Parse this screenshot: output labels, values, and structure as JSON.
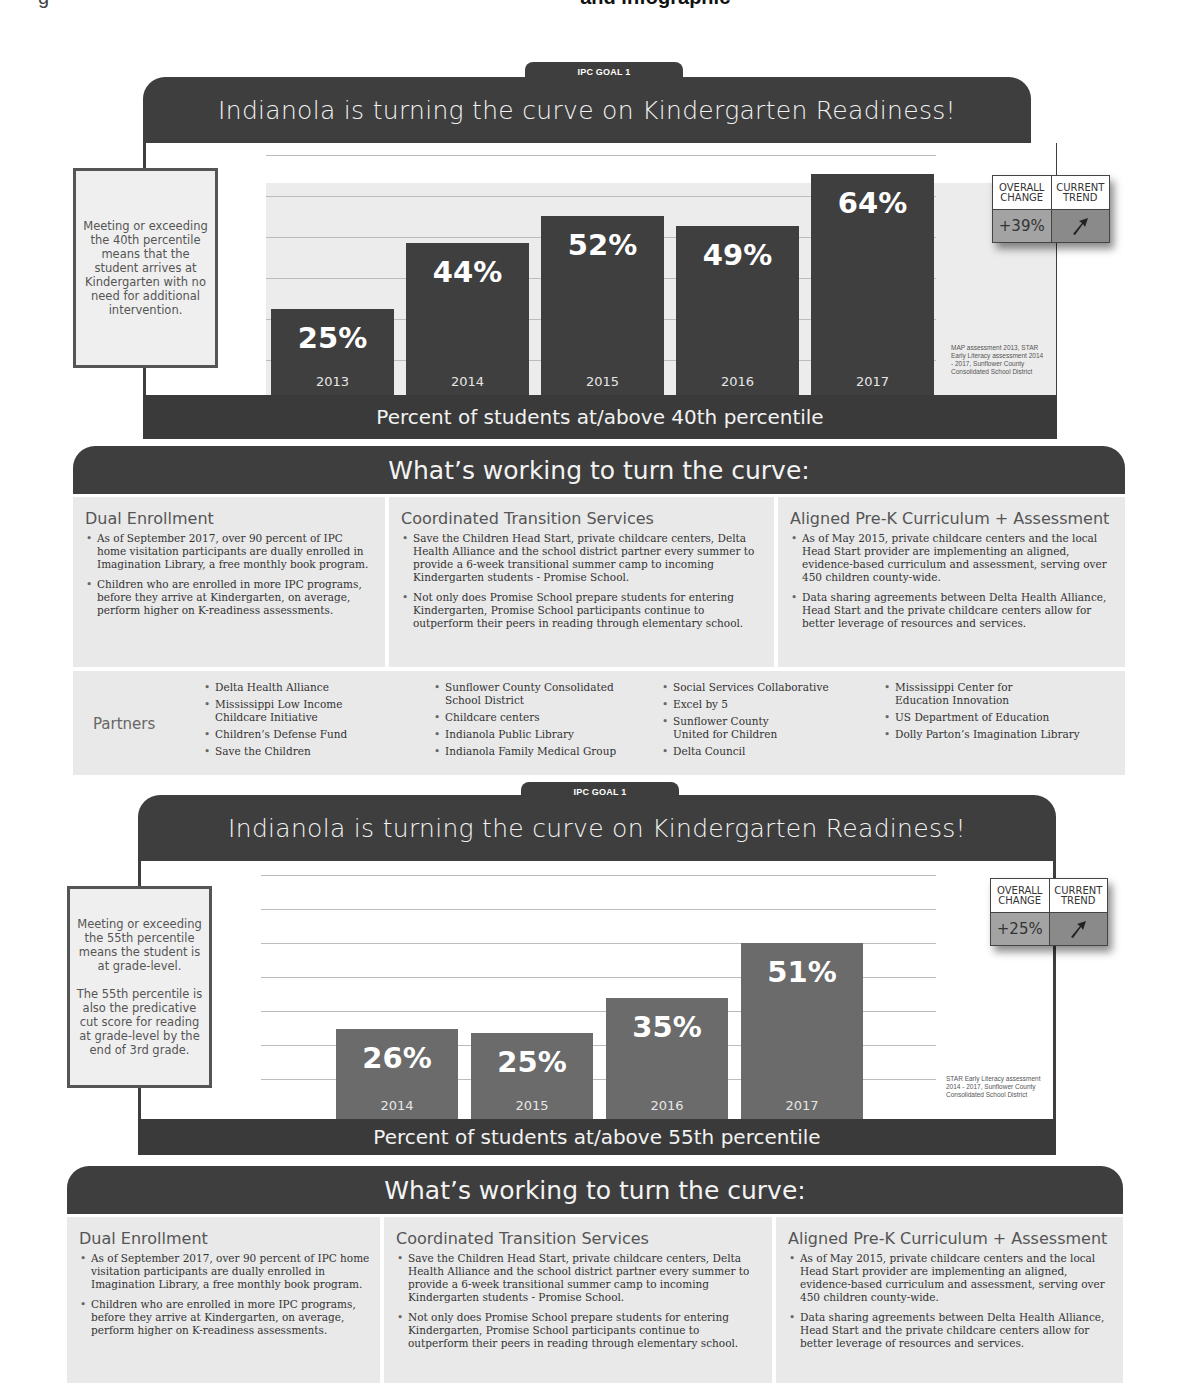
{
  "caption": {
    "prefix": "g",
    "bold_suffix": "and infographic"
  },
  "goals": [
    {
      "tab_label": "IPC GOAL 1",
      "title": "Indianola is turning the curve on Kindergarten Readiness!",
      "note_paragraphs": [
        "Meeting or exceeding the 40th percentile means that the student arrives at Kindergarten with no need for additional intervention."
      ],
      "footer": "Percent of students at/above 40th percentile",
      "source": "MAP assessment 2013, STAR Early Literacy assessment 2014 - 2017, Sunflower County Consolidated School District",
      "change": {
        "overall_label": "OVERALL CHANGE",
        "trend_label": "CURRENT TREND",
        "overall_value": "+39%",
        "trend_icon": "arrow-up-right-icon"
      },
      "bar_color": "#3f3f3f",
      "bars": [
        {
          "year": "2013",
          "label": "25%",
          "value": 25
        },
        {
          "year": "2014",
          "label": "44%",
          "value": 44
        },
        {
          "year": "2015",
          "label": "52%",
          "value": 52
        },
        {
          "year": "2016",
          "label": "49%",
          "value": 49
        },
        {
          "year": "2017",
          "label": "64%",
          "value": 64
        }
      ]
    },
    {
      "tab_label": "IPC GOAL 1",
      "title": "Indianola is turning the curve on Kindergarten Readiness!",
      "note_paragraphs": [
        "Meeting or exceeding the 55th percentile means the student is at grade-level.",
        "The 55th percentile is also the predicative cut score for reading at grade-level by the end of 3rd grade."
      ],
      "footer": "Percent of students at/above 55th percentile",
      "source": "STAR Early Literacy assessment 2014 - 2017, Sunflower County Consolidated School District",
      "change": {
        "overall_label": "OVERALL CHANGE",
        "trend_label": "CURRENT TREND",
        "overall_value": "+25%",
        "trend_icon": "arrow-up-right-icon"
      },
      "bar_color": "#6b6b6b",
      "bars": [
        {
          "year": "2014",
          "label": "26%",
          "value": 26
        },
        {
          "year": "2015",
          "label": "25%",
          "value": 25
        },
        {
          "year": "2016",
          "label": "35%",
          "value": 35
        },
        {
          "year": "2017",
          "label": "51%",
          "value": 51
        }
      ]
    }
  ],
  "working": [
    {
      "header": "What’s working to turn the curve:",
      "columns": [
        {
          "title": "Dual Enrollment",
          "items": [
            "As of September 2017, over 90 percent of IPC home visitation participants are dually enrolled in Imagination Library, a free monthly book program.",
            "Children who are enrolled in more IPC programs, before they arrive at Kindergarten, on average, perform higher on K-readiness assessments."
          ]
        },
        {
          "title": "Coordinated Transition Services",
          "items": [
            "Save the Children Head Start, private childcare centers, Delta Health Alliance and the school district partner every summer to provide a 6-week transitional summer camp to incoming Kindergarten students - Promise School.",
            "Not only does Promise School prepare students for entering Kindergarten, Promise School participants continue to outperform their peers in reading through elementary school."
          ]
        },
        {
          "title": "Aligned Pre-K Curriculum + Assessment",
          "items": [
            "As of May 2015, private childcare centers and the local Head Start provider are implementing an aligned, evidence-based curriculum and assessment, serving over 450 children county-wide.",
            "Data sharing agreements between Delta Health Alliance, Head Start and the private childcare centers allow for better leverage of resources and services."
          ]
        }
      ],
      "partners": {
        "label": "Partners",
        "groups": [
          [
            "Delta Health Alliance",
            "Mississippi Low Income Childcare Initiative",
            "Children’s Defense Fund",
            "Save the Children"
          ],
          [
            "Sunflower County Consolidated School District",
            "Childcare centers",
            "Indianola Public Library",
            "Indianola Family Medical Group"
          ],
          [
            "Social Services Collaborative",
            "Excel by 5",
            "Sunflower County United for Children",
            "Delta Council"
          ],
          [
            "Mississippi Center for Education Innovation",
            "US Department of Education",
            "Dolly Parton’s Imagination Library"
          ]
        ]
      }
    },
    {
      "header": "What’s working to turn the curve:",
      "columns": [
        {
          "title": "Dual Enrollment",
          "items": [
            "As of September 2017, over 90 percent of IPC home visitation participants are dually enrolled in Imagination Library, a free monthly book program.",
            "Children who are enrolled in more IPC programs, before they arrive at Kindergarten, on average, perform higher on K-readiness assessments."
          ]
        },
        {
          "title": "Coordinated Transition Services",
          "items": [
            "Save the Children Head Start, private childcare centers, Delta Health Alliance and the school district partner every summer to provide a 6-week transitional summer camp to incoming Kindergarten students - Promise School.",
            "Not only does Promise School prepare students for entering Kindergarten, Promise School participants continue to outperform their peers in reading through elementary school."
          ]
        },
        {
          "title": "Aligned Pre-K Curriculum + Assessment",
          "items": [
            "As of May 2015, private childcare centers and the local Head Start provider are implementing an aligned, evidence-based curriculum and assessment, serving over 450 children county-wide.",
            "Data sharing agreements between Delta Health Alliance, Head Start and the private childcare centers allow for better leverage of resources and services."
          ]
        }
      ]
    }
  ],
  "chart_data": [
    {
      "type": "bar",
      "title": "Indianola is turning the curve on Kindergarten Readiness!",
      "xlabel": "Percent of students at/above 40th percentile",
      "ylabel": "",
      "categories": [
        "2013",
        "2014",
        "2015",
        "2016",
        "2017"
      ],
      "values": [
        25,
        44,
        52,
        49,
        64
      ],
      "ylim": [
        0,
        70
      ],
      "grid": true,
      "annotations": [
        "OVERALL CHANGE +39%",
        "CURRENT TREND up"
      ]
    },
    {
      "type": "bar",
      "title": "Indianola is turning the curve on Kindergarten Readiness!",
      "xlabel": "Percent of students at/above 55th percentile",
      "ylabel": "",
      "categories": [
        "2014",
        "2015",
        "2016",
        "2017"
      ],
      "values": [
        26,
        25,
        35,
        51
      ],
      "ylim": [
        0,
        70
      ],
      "grid": true,
      "annotations": [
        "OVERALL CHANGE +25%",
        "CURRENT TREND up"
      ]
    }
  ]
}
